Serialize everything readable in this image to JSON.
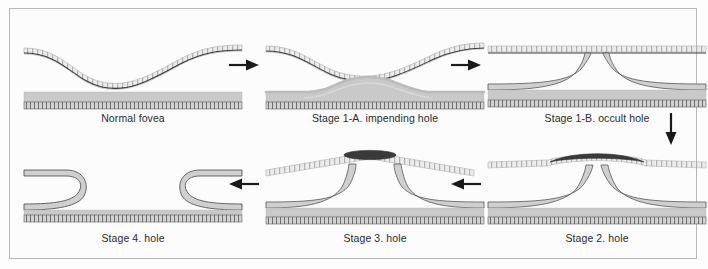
{
  "figure": {
    "background_color": "#fcfcfc",
    "border_color": "#b9b9b9",
    "ink_color": "#2b2b2b",
    "tissue_gray": "#c9c9c9",
    "operculum_color": "#3a3a3a"
  },
  "panels": [
    {
      "id": "normal-fovea",
      "caption": "Normal fovea",
      "row": 1,
      "column": 1,
      "stage": "normal",
      "description": "Intact foveal depression with attached posterior hyaloid following the retinal contour"
    },
    {
      "id": "stage-1a",
      "caption": "Stage 1-A. impending hole",
      "row": 1,
      "column": 2,
      "stage": "1-A",
      "description": "Foveal pseudocyst; subfoveal tissue elevates while hyaloid detaches over the fovea"
    },
    {
      "id": "stage-1b",
      "caption": "Stage 1-B. occult hole",
      "row": 1,
      "column": 3,
      "stage": "1-B",
      "description": "Occult hole with retinal edges curving away beneath a still-attached roof"
    },
    {
      "id": "stage-2",
      "caption": "Stage 2. hole",
      "row": 2,
      "column": 3,
      "stage": "2",
      "description": "Full-thickness hole with attached operculum lifted at the roof"
    },
    {
      "id": "stage-3",
      "caption": "Stage 3. hole",
      "row": 2,
      "column": 2,
      "stage": "3",
      "description": "Enlarged hole with free operculum on detached posterior hyaloid"
    },
    {
      "id": "stage-4",
      "caption": "Stage 4. hole",
      "row": 2,
      "column": 1,
      "stage": "4",
      "description": "Full-thickness hole with complete posterior vitreous detachment"
    }
  ],
  "arrows": [
    {
      "id": "arrow-normal-to-1a",
      "direction": "right"
    },
    {
      "id": "arrow-1a-to-1b",
      "direction": "right"
    },
    {
      "id": "arrow-1b-to-2",
      "direction": "down"
    },
    {
      "id": "arrow-2-to-3",
      "direction": "left"
    },
    {
      "id": "arrow-3-to-4",
      "direction": "left"
    }
  ]
}
